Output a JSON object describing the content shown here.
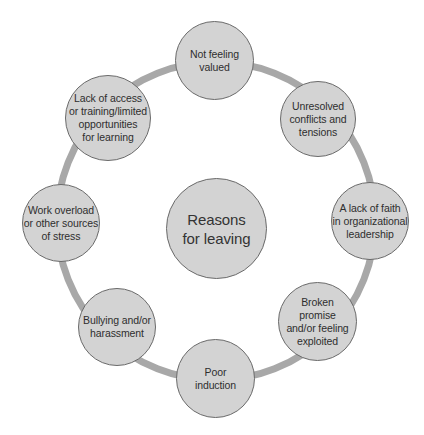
{
  "diagram": {
    "type": "cycle",
    "ring_color": "#a8a8a8",
    "node_fill": "#d3d3d3",
    "node_border": "#6a6a6a",
    "center": {
      "label": "Reasons\nfor leaving"
    },
    "nodes": [
      {
        "label": "Not feeling\nvalued"
      },
      {
        "label": "Unresolved\nconflicts and\ntensions"
      },
      {
        "label": "A lack of faith\nin organizational\nleadership"
      },
      {
        "label": "Broken\npromise\nand/or feeling\nexploited"
      },
      {
        "label": "Poor\ninduction"
      },
      {
        "label": "Bullying and/or\nharassment"
      },
      {
        "label": "Work overload\nor other sources\nof stress"
      },
      {
        "label": "Lack of access\nor training/limited\nopportunities\nfor learning"
      }
    ]
  }
}
